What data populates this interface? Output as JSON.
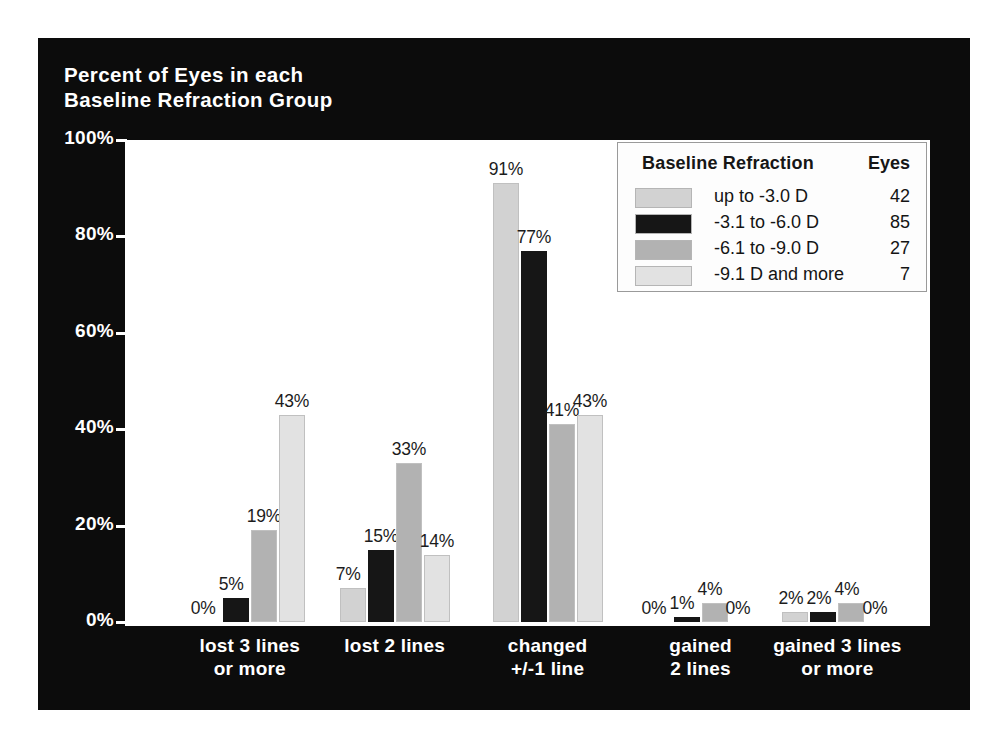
{
  "chart_data": {
    "type": "bar",
    "title": "Percent of Eyes in each\nBaseline Refraction Group",
    "xlabel": "",
    "ylabel": "",
    "ylim": [
      0,
      100
    ],
    "yticks": [
      "0%",
      "20%",
      "40%",
      "60%",
      "80%",
      "100%"
    ],
    "ytick_values": [
      0,
      20,
      40,
      60,
      80,
      100
    ],
    "grid": false,
    "legend_position": "top-right",
    "legend_title": "Baseline Refraction",
    "legend_count_header": "Eyes",
    "categories": [
      "lost 3 lines\nor more",
      "lost 2 lines",
      "changed\n+/-1 line",
      "gained\n2 lines",
      "gained 3 lines\nor more"
    ],
    "series": [
      {
        "name": "up to  -3.0 D",
        "eyes": "42",
        "color": "#d2d2d2",
        "values": [
          0,
          7,
          91,
          0,
          2
        ],
        "labels": [
          "0%",
          "7%",
          "91%",
          "0%",
          "2%"
        ]
      },
      {
        "name": "-3.1 to -6.0 D",
        "eyes": "85",
        "color": "#161616",
        "values": [
          5,
          15,
          77,
          1,
          2
        ],
        "labels": [
          "5%",
          "15%",
          "77%",
          "1%",
          "2%"
        ]
      },
      {
        "name": "-6.1 to -9.0 D",
        "eyes": "27",
        "color": "#b2b2b2",
        "values": [
          19,
          33,
          41,
          4,
          4
        ],
        "labels": [
          "19%",
          "33%",
          "41%",
          "4%",
          "4%"
        ]
      },
      {
        "name": "-9.1 D and more",
        "eyes": "7",
        "color": "#e2e2e2",
        "values": [
          43,
          14,
          43,
          0,
          0
        ],
        "labels": [
          "43%",
          "14%",
          "43%",
          "0%",
          "0%"
        ]
      }
    ]
  },
  "colors": {
    "slide_background": "#0c0c0c",
    "plot_background": "#ffffff",
    "axis_text": "#ffffff",
    "label_text": "#1c1c1c"
  }
}
